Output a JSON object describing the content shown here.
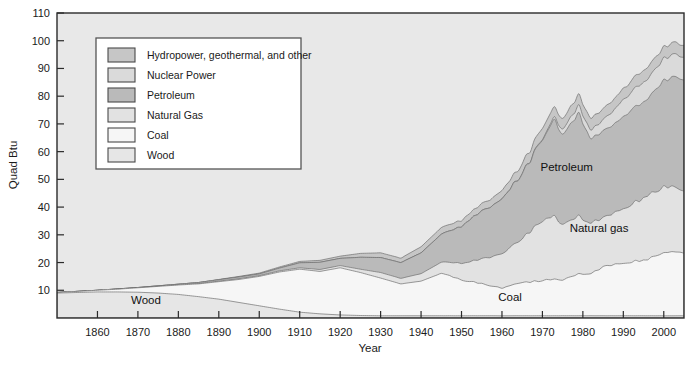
{
  "chart_data": {
    "type": "area",
    "stacked": true,
    "title": "",
    "subtitle": "",
    "xlabel": "Year",
    "ylabel": "Quad Btu",
    "xlim": [
      1850,
      2005
    ],
    "ylim": [
      0,
      110
    ],
    "ytick_values": [
      10,
      20,
      30,
      40,
      50,
      60,
      70,
      80,
      90,
      100,
      110
    ],
    "ytick_labels": [
      "10",
      "20",
      "30",
      "40",
      "50",
      "60",
      "70",
      "80",
      "90",
      "100",
      "110"
    ],
    "xtick_values": [
      1860,
      1870,
      1880,
      1890,
      1900,
      1910,
      1920,
      1930,
      1940,
      1950,
      1960,
      1970,
      1980,
      1990,
      2000
    ],
    "xtick_labels": [
      "1860",
      "1870",
      "1880",
      "1890",
      "1900",
      "1910",
      "1920",
      "1930",
      "1940",
      "1950",
      "1960",
      "1970",
      "1980",
      "1990",
      "2000"
    ],
    "grid": false,
    "plot_background": "#e8e8e8",
    "legend": {
      "position": "upper-left-inside",
      "background": "#ffffff",
      "entries": [
        {
          "label": "Hydropower, geothermal, and other",
          "color": "#c6c6c6"
        },
        {
          "label": "Nuclear Power",
          "color": "#dadada"
        },
        {
          "label": "Petroleum",
          "color": "#bababa"
        },
        {
          "label": "Natural Gas",
          "color": "#e2e2e2"
        },
        {
          "label": "Coal",
          "color": "#f6f6f6"
        },
        {
          "label": "Wood",
          "color": "#e6e6e6"
        }
      ]
    },
    "annotations": [
      {
        "text": "Wood",
        "x": 1872,
        "y": 5
      },
      {
        "text": "Coal",
        "x": 1962,
        "y": 6
      },
      {
        "text": "Natural gas",
        "x": 1984,
        "y": 31
      },
      {
        "text": "Petroleum",
        "x": 1976,
        "y": 53
      }
    ],
    "x": [
      1850,
      1855,
      1860,
      1865,
      1870,
      1875,
      1880,
      1885,
      1890,
      1895,
      1900,
      1905,
      1910,
      1915,
      1920,
      1925,
      1930,
      1935,
      1940,
      1945,
      1950,
      1955,
      1960,
      1965,
      1970,
      1973,
      1975,
      1979,
      1982,
      1985,
      1990,
      1995,
      2000,
      2005
    ],
    "series": [
      {
        "name": "Wood",
        "color": "#e6e6e6",
        "values": [
          9.0,
          9.2,
          9.4,
          9.4,
          9.3,
          9.0,
          8.5,
          7.7,
          6.8,
          5.6,
          4.4,
          3.2,
          2.1,
          1.5,
          1.1,
          0.9,
          0.8,
          0.8,
          0.8,
          0.8,
          0.8,
          0.8,
          0.8,
          0.8,
          0.8,
          0.8,
          0.8,
          0.8,
          0.8,
          0.8,
          0.8,
          0.8,
          0.8,
          0.8
        ]
      },
      {
        "name": "Coal",
        "color": "#f6f6f6",
        "values": [
          0.2,
          0.4,
          0.6,
          1.0,
          1.6,
          2.4,
          3.4,
          4.6,
          6.3,
          8.3,
          10.6,
          13.4,
          15.5,
          15.3,
          17.0,
          15.5,
          13.6,
          11.5,
          12.5,
          15.3,
          12.9,
          11.6,
          10.1,
          11.9,
          12.7,
          13.3,
          12.8,
          15.1,
          15.3,
          17.5,
          19.2,
          20.1,
          22.6,
          22.8
        ]
      },
      {
        "name": "Natural Gas",
        "color": "#e2e2e2",
        "values": [
          0.0,
          0.0,
          0.0,
          0.0,
          0.0,
          0.0,
          0.0,
          0.1,
          0.2,
          0.3,
          0.3,
          0.4,
          0.5,
          0.7,
          0.8,
          1.2,
          2.0,
          2.0,
          2.7,
          4.0,
          6.0,
          9.0,
          12.4,
          15.8,
          21.8,
          22.5,
          19.9,
          20.7,
          18.4,
          17.8,
          19.6,
          22.2,
          23.9,
          22.6
        ]
      },
      {
        "name": "Petroleum",
        "color": "#bababa",
        "values": [
          0.0,
          0.0,
          0.0,
          0.1,
          0.1,
          0.2,
          0.3,
          0.4,
          0.5,
          0.6,
          0.6,
          1.0,
          1.8,
          2.6,
          2.6,
          4.3,
          5.4,
          5.7,
          7.5,
          10.1,
          13.3,
          17.3,
          19.9,
          23.2,
          29.5,
          34.8,
          32.7,
          37.1,
          30.2,
          30.9,
          33.6,
          34.4,
          38.3,
          40.4
        ]
      },
      {
        "name": "Nuclear Power",
        "color": "#dadada",
        "values": [
          0.0,
          0.0,
          0.0,
          0.0,
          0.0,
          0.0,
          0.0,
          0.0,
          0.0,
          0.0,
          0.0,
          0.0,
          0.0,
          0.0,
          0.0,
          0.0,
          0.0,
          0.0,
          0.0,
          0.0,
          0.0,
          0.0,
          0.01,
          0.04,
          0.24,
          0.91,
          1.9,
          2.8,
          3.1,
          4.1,
          6.1,
          7.1,
          7.9,
          8.2
        ]
      },
      {
        "name": "Hydropower, geothermal, and other",
        "color": "#c6c6c6",
        "values": [
          0.0,
          0.0,
          0.0,
          0.0,
          0.0,
          0.0,
          0.0,
          0.0,
          0.1,
          0.2,
          0.3,
          0.4,
          0.5,
          0.7,
          0.8,
          1.4,
          1.7,
          1.6,
          2.2,
          2.4,
          2.2,
          2.6,
          3.0,
          3.5,
          4.0,
          3.6,
          3.8,
          3.9,
          4.3,
          3.9,
          4.0,
          4.3,
          4.1,
          4.3
        ]
      }
    ]
  }
}
